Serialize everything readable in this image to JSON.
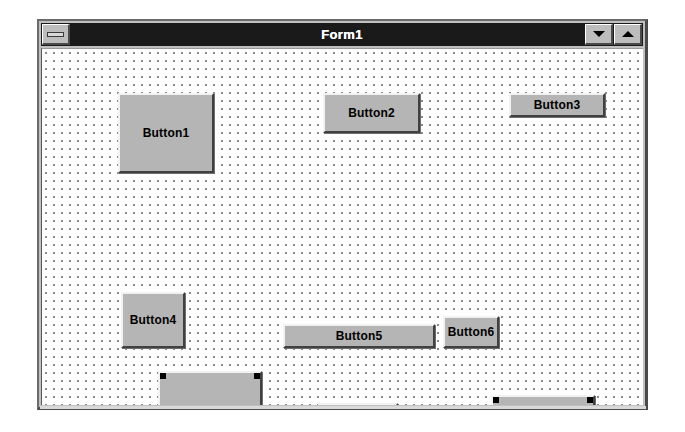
{
  "window": {
    "title": "Form1",
    "sys_menu_icon": "control-box-icon",
    "minimize_icon": "arrow-down-icon",
    "maximize_icon": "arrow-up-icon",
    "colors": {
      "titlebar_bg": "#1a1a1a",
      "titlebar_text": "#ffffff",
      "frame": "#c0c0c0",
      "client_bg": "#ffffff",
      "grid_dot": "#8a8a8a",
      "button_face": "#b5b5b5",
      "button_highlight": "#f2f2f2",
      "button_shadow": "#404040",
      "selection_handle": "#000000"
    },
    "grid": {
      "visible": true,
      "spacing_px": 8,
      "dot_color": "#8a8a8a"
    }
  },
  "controls": [
    {
      "name": "Button1",
      "label": "Button1",
      "x": 76,
      "y": 44,
      "w": 96,
      "h": 80,
      "selected": false
    },
    {
      "name": "Button2",
      "label": "Button2",
      "x": 281,
      "y": 44,
      "w": 97,
      "h": 40,
      "selected": false
    },
    {
      "name": "Button3",
      "label": "Button3",
      "x": 467,
      "y": 44,
      "w": 96,
      "h": 24,
      "selected": false
    },
    {
      "name": "Button4",
      "label": "Button4",
      "x": 79,
      "y": 243,
      "w": 64,
      "h": 56,
      "selected": false
    },
    {
      "name": "Button5",
      "label": "Button5",
      "x": 241,
      "y": 275,
      "w": 152,
      "h": 24,
      "selected": false
    },
    {
      "name": "Button6",
      "label": "Button6",
      "x": 401,
      "y": 267,
      "w": 56,
      "h": 32,
      "selected": false
    },
    {
      "name": "Button7",
      "label": "Button7",
      "x": 116,
      "y": 322,
      "w": 104,
      "h": 96,
      "selected": true
    },
    {
      "name": "Button8",
      "label": "Button8",
      "x": 276,
      "y": 354,
      "w": 80,
      "h": 40,
      "selected": true
    },
    {
      "name": "Button9",
      "label": "Button9",
      "x": 449,
      "y": 346,
      "w": 104,
      "h": 48,
      "selected": true
    }
  ]
}
